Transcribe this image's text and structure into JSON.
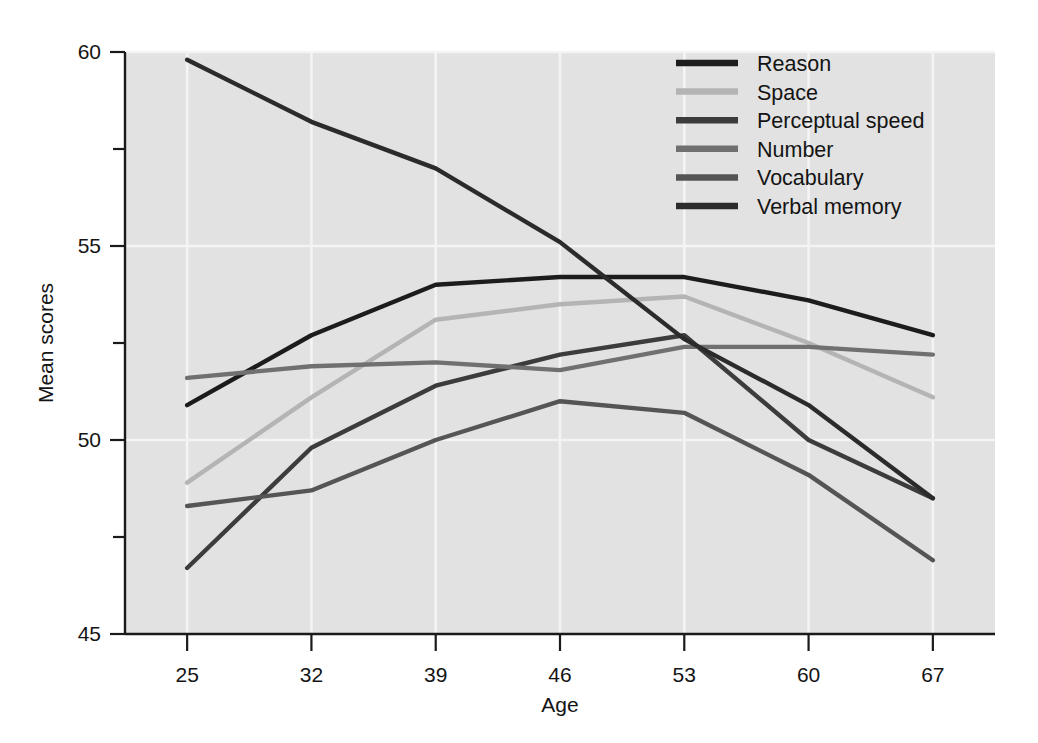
{
  "chart_data": {
    "type": "line",
    "title": "",
    "xlabel": "Age",
    "ylabel": "Mean scores",
    "x": [
      25,
      32,
      39,
      46,
      53,
      60,
      67
    ],
    "x_tick_labels": [
      "25",
      "32",
      "39",
      "46",
      "53",
      "60",
      "67"
    ],
    "y_tick_labels": [
      "45",
      "50",
      "55",
      "60"
    ],
    "y_ticks": [
      45,
      50,
      55,
      60
    ],
    "y_minor_ticks": [
      47.5,
      52.5,
      57.5
    ],
    "xlim": [
      21.5,
      70.5
    ],
    "ylim": [
      45,
      60
    ],
    "grid": "both-light-on-gray",
    "legend_position": "top-right-inside",
    "plot_background": "#e2e2e2",
    "figure_background": "#ffffff",
    "series": [
      {
        "name": "Reason",
        "color": "#1c1c1c",
        "width": 4.4,
        "values": [
          50.9,
          52.7,
          54.0,
          54.2,
          54.2,
          53.6,
          52.7
        ]
      },
      {
        "name": "Space",
        "color": "#b4b4b4",
        "width": 4.4,
        "values": [
          48.9,
          51.1,
          53.1,
          53.5,
          53.7,
          52.5,
          51.1
        ]
      },
      {
        "name": "Perceptual speed",
        "color": "#3c3c3c",
        "width": 4.4,
        "values": [
          46.7,
          49.8,
          51.4,
          52.2,
          52.7,
          50.0,
          48.5
        ]
      },
      {
        "name": "Number",
        "color": "#707070",
        "width": 4.4,
        "values": [
          51.6,
          51.9,
          52.0,
          51.8,
          52.4,
          52.4,
          52.2
        ]
      },
      {
        "name": "Vocabulary",
        "color": "#555555",
        "width": 4.4,
        "values": [
          48.3,
          48.7,
          50.0,
          51.0,
          50.7,
          49.1,
          46.9
        ]
      },
      {
        "name": "Verbal memory",
        "color": "#2b2b2b",
        "width": 4.4,
        "values": [
          59.8,
          58.2,
          57.0,
          55.1,
          52.6,
          50.9,
          48.5
        ]
      }
    ]
  },
  "legend": {
    "entries": [
      {
        "label": "Reason",
        "color": "#1c1c1c"
      },
      {
        "label": "Space",
        "color": "#b4b4b4"
      },
      {
        "label": "Perceptual speed",
        "color": "#3c3c3c"
      },
      {
        "label": "Number",
        "color": "#707070"
      },
      {
        "label": "Vocabulary",
        "color": "#555555"
      },
      {
        "label": "Verbal memory",
        "color": "#2b2b2b"
      }
    ]
  },
  "axes": {
    "x_title": "Age",
    "y_title": "Mean scores",
    "x_labels": [
      "25",
      "32",
      "39",
      "46",
      "53",
      "60",
      "67"
    ],
    "y_labels": [
      "60",
      "55",
      "50",
      "45"
    ]
  }
}
